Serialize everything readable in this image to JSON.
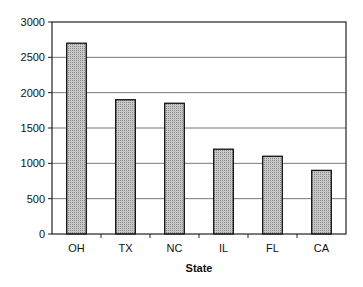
{
  "chart_data": {
    "type": "bar",
    "title": "",
    "xlabel": "State",
    "ylabel": "",
    "categories": [
      "OH",
      "TX",
      "NC",
      "IL",
      "FL",
      "CA"
    ],
    "values": [
      2700,
      1900,
      1850,
      1200,
      1100,
      900
    ],
    "ylim": [
      0,
      3000
    ],
    "yticks": [
      0,
      500,
      1000,
      1500,
      2000,
      2500,
      3000
    ],
    "grid": true,
    "legend": "none",
    "bar_color": "#b8b8b8",
    "bar_pattern": "stippled gray"
  }
}
